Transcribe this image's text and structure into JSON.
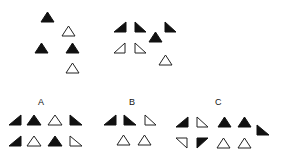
{
  "colors": {
    "fill": "#111111",
    "stroke": "#222222",
    "background": "#ffffff"
  },
  "labels": [
    {
      "id": "A",
      "text": "A",
      "x": 38,
      "y": 98
    },
    {
      "id": "B",
      "text": "B",
      "x": 129,
      "y": 98
    },
    {
      "id": "C",
      "text": "C",
      "x": 215,
      "y": 98
    }
  ],
  "shapes": [
    {
      "group": "example-1",
      "kind": "equilateral",
      "filled": true,
      "x": 41,
      "y": 12,
      "w": 13,
      "h": 10
    },
    {
      "group": "example-1",
      "kind": "equilateral",
      "filled": false,
      "x": 62,
      "y": 26,
      "w": 13,
      "h": 10
    },
    {
      "group": "example-1",
      "kind": "equilateral",
      "filled": true,
      "x": 35,
      "y": 43,
      "w": 13,
      "h": 10
    },
    {
      "group": "example-1",
      "kind": "equilateral",
      "filled": true,
      "x": 66,
      "y": 43,
      "w": 13,
      "h": 10
    },
    {
      "group": "example-1",
      "kind": "equilateral",
      "filled": false,
      "x": 66,
      "y": 63,
      "w": 13,
      "h": 10
    },
    {
      "group": "example-2",
      "kind": "right-br",
      "filled": true,
      "x": 114,
      "y": 22,
      "w": 12,
      "h": 10
    },
    {
      "group": "example-2",
      "kind": "right-bl",
      "filled": true,
      "x": 135,
      "y": 22,
      "w": 11,
      "h": 10
    },
    {
      "group": "example-2",
      "kind": "equilateral",
      "filled": true,
      "x": 149,
      "y": 32,
      "w": 13,
      "h": 10
    },
    {
      "group": "example-2",
      "kind": "right-bl",
      "filled": true,
      "x": 165,
      "y": 22,
      "w": 11,
      "h": 10
    },
    {
      "group": "example-2",
      "kind": "right-br",
      "filled": false,
      "x": 114,
      "y": 43,
      "w": 11,
      "h": 10
    },
    {
      "group": "example-2",
      "kind": "right-bl",
      "filled": false,
      "x": 135,
      "y": 43,
      "w": 11,
      "h": 10
    },
    {
      "group": "example-2",
      "kind": "equilateral",
      "filled": false,
      "x": 159,
      "y": 55,
      "w": 13,
      "h": 10
    },
    {
      "group": "A",
      "kind": "right-br",
      "filled": true,
      "x": 9,
      "y": 115,
      "w": 12,
      "h": 10
    },
    {
      "group": "A",
      "kind": "equilateral",
      "filled": true,
      "x": 27,
      "y": 115,
      "w": 14,
      "h": 10
    },
    {
      "group": "A",
      "kind": "equilateral",
      "filled": false,
      "x": 48,
      "y": 115,
      "w": 14,
      "h": 10
    },
    {
      "group": "A",
      "kind": "right-bl",
      "filled": true,
      "x": 70,
      "y": 115,
      "w": 12,
      "h": 10
    },
    {
      "group": "A",
      "kind": "right-br",
      "filled": true,
      "x": 9,
      "y": 136,
      "w": 12,
      "h": 10
    },
    {
      "group": "A",
      "kind": "equilateral",
      "filled": false,
      "x": 27,
      "y": 136,
      "w": 14,
      "h": 10
    },
    {
      "group": "A",
      "kind": "equilateral",
      "filled": true,
      "x": 48,
      "y": 136,
      "w": 14,
      "h": 10
    },
    {
      "group": "A",
      "kind": "right-bl",
      "filled": false,
      "x": 70,
      "y": 136,
      "w": 12,
      "h": 10
    },
    {
      "group": "B",
      "kind": "right-br",
      "filled": true,
      "x": 104,
      "y": 115,
      "w": 12,
      "h": 10
    },
    {
      "group": "B",
      "kind": "right-bl",
      "filled": true,
      "x": 124,
      "y": 115,
      "w": 12,
      "h": 10
    },
    {
      "group": "B",
      "kind": "right-bl",
      "filled": false,
      "x": 145,
      "y": 115,
      "w": 11,
      "h": 10
    },
    {
      "group": "B",
      "kind": "equilateral",
      "filled": false,
      "x": 117,
      "y": 135,
      "w": 13,
      "h": 10
    },
    {
      "group": "B",
      "kind": "equilateral",
      "filled": false,
      "x": 138,
      "y": 135,
      "w": 13,
      "h": 10
    },
    {
      "group": "C",
      "kind": "right-br",
      "filled": true,
      "x": 176,
      "y": 117,
      "w": 12,
      "h": 10
    },
    {
      "group": "C",
      "kind": "right-bl",
      "filled": false,
      "x": 197,
      "y": 117,
      "w": 11,
      "h": 10
    },
    {
      "group": "C",
      "kind": "equilateral",
      "filled": true,
      "x": 218,
      "y": 117,
      "w": 13,
      "h": 10
    },
    {
      "group": "C",
      "kind": "equilateral",
      "filled": true,
      "x": 238,
      "y": 117,
      "w": 13,
      "h": 10
    },
    {
      "group": "C",
      "kind": "right-bl",
      "filled": true,
      "x": 257,
      "y": 125,
      "w": 12,
      "h": 10
    },
    {
      "group": "C",
      "kind": "right-tr",
      "filled": false,
      "x": 176,
      "y": 138,
      "w": 11,
      "h": 10
    },
    {
      "group": "C",
      "kind": "right-tl",
      "filled": true,
      "x": 197,
      "y": 138,
      "w": 11,
      "h": 10
    },
    {
      "group": "C",
      "kind": "equilateral",
      "filled": false,
      "x": 217,
      "y": 138,
      "w": 13,
      "h": 10
    },
    {
      "group": "C",
      "kind": "equilateral",
      "filled": false,
      "x": 238,
      "y": 138,
      "w": 13,
      "h": 10
    }
  ]
}
